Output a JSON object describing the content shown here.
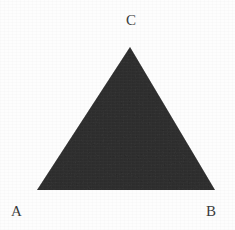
{
  "figure": {
    "background_color": "#fdfdfd",
    "width": 235,
    "height": 230
  },
  "shape": {
    "name": "triangle",
    "type": "polygon",
    "fill_color": "#6e6e6e",
    "stroke_color": "none",
    "vertices": [
      {
        "label": "C",
        "x": 130,
        "y": 47
      },
      {
        "label": "B",
        "x": 215,
        "y": 190
      },
      {
        "label": "A",
        "x": 37,
        "y": 190
      }
    ],
    "points_attr": "130,47 215,190 37,190"
  },
  "labels": {
    "text_color": "#3a3a3a",
    "apex": "C",
    "bottom_left": "A",
    "bottom_right": "B"
  }
}
